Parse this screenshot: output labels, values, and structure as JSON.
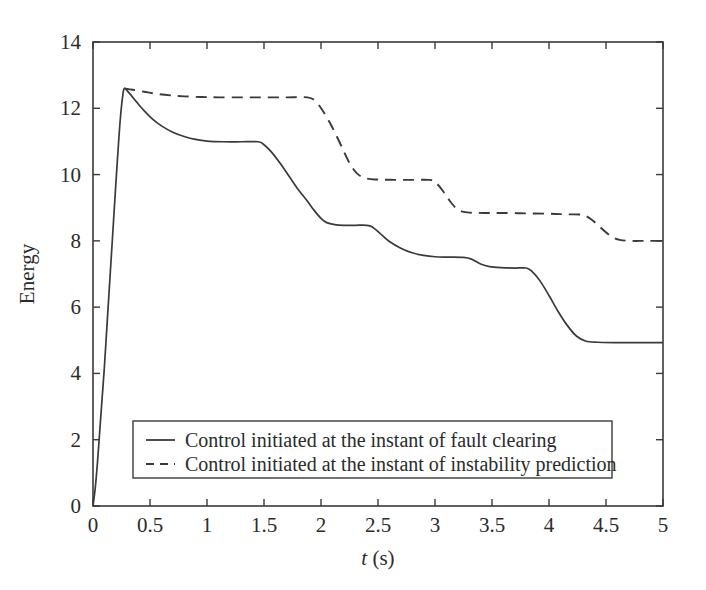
{
  "chart_data": {
    "type": "line",
    "title": "",
    "xlabel": "t (s)",
    "xlabel_italic_part": "t",
    "xlabel_rest": " (s)",
    "ylabel": "Energy",
    "xlim": [
      0,
      5
    ],
    "ylim": [
      0,
      14
    ],
    "xticks": [
      "0",
      "0.5",
      "1",
      "1.5",
      "2",
      "2.5",
      "3",
      "3.5",
      "4",
      "4.5",
      "5"
    ],
    "xtick_values": [
      0,
      0.5,
      1,
      1.5,
      2,
      2.5,
      3,
      3.5,
      4,
      4.5,
      5
    ],
    "yticks": [
      "0",
      "2",
      "4",
      "6",
      "8",
      "10",
      "12",
      "14"
    ],
    "ytick_values": [
      0,
      2,
      4,
      6,
      8,
      10,
      12,
      14
    ],
    "grid": false,
    "legend_position": "lower-center",
    "line_color": "#3a3a3a",
    "series": [
      {
        "name": "Control initiated at the instant of fault clearing",
        "style": "solid",
        "points": [
          [
            0.0,
            0.0
          ],
          [
            0.02,
            0.55
          ],
          [
            0.04,
            1.35
          ],
          [
            0.06,
            2.3
          ],
          [
            0.08,
            3.25
          ],
          [
            0.1,
            4.2
          ],
          [
            0.12,
            5.3
          ],
          [
            0.14,
            6.4
          ],
          [
            0.16,
            7.5
          ],
          [
            0.18,
            8.6
          ],
          [
            0.2,
            9.7
          ],
          [
            0.22,
            10.75
          ],
          [
            0.24,
            11.7
          ],
          [
            0.26,
            12.35
          ],
          [
            0.275,
            12.6
          ],
          [
            0.32,
            12.45
          ],
          [
            0.38,
            12.2
          ],
          [
            0.45,
            11.92
          ],
          [
            0.52,
            11.68
          ],
          [
            0.6,
            11.47
          ],
          [
            0.7,
            11.28
          ],
          [
            0.8,
            11.15
          ],
          [
            0.9,
            11.06
          ],
          [
            1.0,
            11.01
          ],
          [
            1.15,
            10.99
          ],
          [
            1.3,
            10.99
          ],
          [
            1.45,
            10.99
          ],
          [
            1.5,
            10.9
          ],
          [
            1.56,
            10.7
          ],
          [
            1.64,
            10.35
          ],
          [
            1.72,
            9.95
          ],
          [
            1.8,
            9.55
          ],
          [
            1.88,
            9.2
          ],
          [
            1.94,
            8.92
          ],
          [
            2.0,
            8.68
          ],
          [
            2.05,
            8.55
          ],
          [
            2.12,
            8.49
          ],
          [
            2.2,
            8.47
          ],
          [
            2.3,
            8.47
          ],
          [
            2.4,
            8.47
          ],
          [
            2.45,
            8.42
          ],
          [
            2.52,
            8.22
          ],
          [
            2.6,
            7.98
          ],
          [
            2.7,
            7.78
          ],
          [
            2.8,
            7.64
          ],
          [
            2.9,
            7.56
          ],
          [
            3.0,
            7.52
          ],
          [
            3.12,
            7.51
          ],
          [
            3.25,
            7.5
          ],
          [
            3.32,
            7.45
          ],
          [
            3.4,
            7.3
          ],
          [
            3.48,
            7.22
          ],
          [
            3.58,
            7.19
          ],
          [
            3.7,
            7.18
          ],
          [
            3.8,
            7.18
          ],
          [
            3.85,
            7.08
          ],
          [
            3.92,
            6.8
          ],
          [
            4.0,
            6.35
          ],
          [
            4.08,
            5.87
          ],
          [
            4.16,
            5.45
          ],
          [
            4.24,
            5.13
          ],
          [
            4.32,
            4.98
          ],
          [
            4.42,
            4.94
          ],
          [
            4.6,
            4.93
          ],
          [
            4.8,
            4.93
          ],
          [
            5.0,
            4.93
          ]
        ]
      },
      {
        "name": "Control initiated at the instant of instability prediction",
        "style": "dashed",
        "points": [
          [
            0.275,
            12.6
          ],
          [
            0.35,
            12.56
          ],
          [
            0.45,
            12.5
          ],
          [
            0.55,
            12.44
          ],
          [
            0.68,
            12.39
          ],
          [
            0.8,
            12.36
          ],
          [
            0.95,
            12.34
          ],
          [
            1.1,
            12.33
          ],
          [
            1.3,
            12.33
          ],
          [
            1.5,
            12.33
          ],
          [
            1.7,
            12.33
          ],
          [
            1.88,
            12.33
          ],
          [
            1.95,
            12.22
          ],
          [
            2.02,
            11.9
          ],
          [
            2.1,
            11.42
          ],
          [
            2.18,
            10.85
          ],
          [
            2.25,
            10.35
          ],
          [
            2.32,
            10.02
          ],
          [
            2.4,
            9.88
          ],
          [
            2.5,
            9.85
          ],
          [
            2.65,
            9.84
          ],
          [
            2.8,
            9.84
          ],
          [
            2.95,
            9.84
          ],
          [
            3.0,
            9.78
          ],
          [
            3.06,
            9.55
          ],
          [
            3.12,
            9.25
          ],
          [
            3.18,
            9.0
          ],
          [
            3.24,
            8.88
          ],
          [
            3.32,
            8.85
          ],
          [
            3.45,
            8.84
          ],
          [
            3.6,
            8.84
          ],
          [
            3.8,
            8.83
          ],
          [
            4.0,
            8.82
          ],
          [
            4.15,
            8.8
          ],
          [
            4.3,
            8.78
          ],
          [
            4.38,
            8.62
          ],
          [
            4.46,
            8.38
          ],
          [
            4.54,
            8.15
          ],
          [
            4.62,
            8.03
          ],
          [
            4.72,
            8.0
          ],
          [
            4.85,
            8.0
          ],
          [
            5.0,
            8.0
          ]
        ]
      }
    ],
    "legend_entries": [
      {
        "label": "Control initiated at the instant of fault clearing",
        "style": "solid"
      },
      {
        "label": "Control initiated at the instant of instability prediction",
        "style": "dashed"
      }
    ]
  }
}
